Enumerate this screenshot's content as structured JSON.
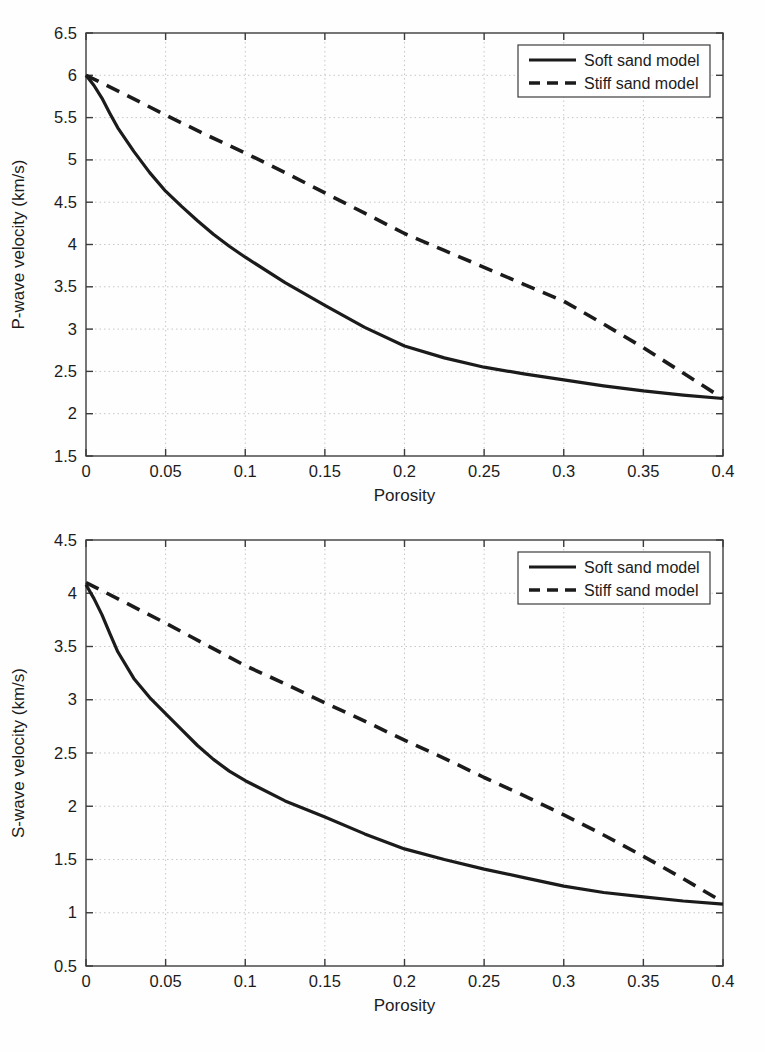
{
  "figure": {
    "background": "#fefefe"
  },
  "colors": {
    "line": "#1b1b1b",
    "axis_box": "#3c3c3c",
    "grid": "#c7c7c7",
    "text": "#1c1c1c",
    "legend_background": "#ffffff"
  },
  "chart_data": [
    {
      "id": "p-wave",
      "type": "line",
      "title": "",
      "xlabel": "Porosity",
      "ylabel": "P-wave velocity (km/s)",
      "xlim": [
        0,
        0.4
      ],
      "ylim": [
        1.5,
        6.5
      ],
      "grid": true,
      "legend_position": "top-right",
      "xticks": [
        0,
        0.05,
        0.1,
        0.15,
        0.2,
        0.25,
        0.3,
        0.35,
        0.4
      ],
      "xtick_labels": [
        "0",
        "0.05",
        "0.1",
        "0.15",
        "0.2",
        "0.25",
        "0.3",
        "0.35",
        "0.4"
      ],
      "yticks": [
        1.5,
        2,
        2.5,
        3,
        3.5,
        4,
        4.5,
        5,
        5.5,
        6,
        6.5
      ],
      "ytick_labels": [
        "1.5",
        "2",
        "2.5",
        "3",
        "3.5",
        "4",
        "4.5",
        "5",
        "5.5",
        "6",
        "6.5"
      ],
      "series": [
        {
          "name": "Soft sand model",
          "style": "solid",
          "x": [
            0,
            0.005,
            0.01,
            0.015,
            0.02,
            0.03,
            0.04,
            0.05,
            0.06,
            0.07,
            0.08,
            0.09,
            0.1,
            0.125,
            0.15,
            0.175,
            0.2,
            0.225,
            0.25,
            0.275,
            0.3,
            0.325,
            0.35,
            0.375,
            0.4
          ],
          "y": [
            6.0,
            5.88,
            5.73,
            5.55,
            5.38,
            5.1,
            4.85,
            4.63,
            4.45,
            4.28,
            4.12,
            3.98,
            3.85,
            3.55,
            3.28,
            3.02,
            2.8,
            2.66,
            2.55,
            2.47,
            2.4,
            2.33,
            2.27,
            2.22,
            2.18
          ]
        },
        {
          "name": "Stiff sand model",
          "style": "dashed",
          "x": [
            0,
            0.025,
            0.05,
            0.075,
            0.1,
            0.125,
            0.15,
            0.175,
            0.2,
            0.225,
            0.25,
            0.275,
            0.3,
            0.325,
            0.35,
            0.375,
            0.4
          ],
          "y": [
            6.0,
            5.77,
            5.53,
            5.3,
            5.08,
            4.85,
            4.61,
            4.37,
            4.13,
            3.93,
            3.73,
            3.53,
            3.33,
            3.06,
            2.78,
            2.48,
            2.18
          ]
        }
      ]
    },
    {
      "id": "s-wave",
      "type": "line",
      "title": "",
      "xlabel": "Porosity",
      "ylabel": "S-wave velocity (km/s)",
      "xlim": [
        0,
        0.4
      ],
      "ylim": [
        0.5,
        4.5
      ],
      "grid": true,
      "legend_position": "top-right",
      "xticks": [
        0,
        0.05,
        0.1,
        0.15,
        0.2,
        0.25,
        0.3,
        0.35,
        0.4
      ],
      "xtick_labels": [
        "0",
        "0.05",
        "0.1",
        "0.15",
        "0.2",
        "0.25",
        "0.3",
        "0.35",
        "0.4"
      ],
      "yticks": [
        0.5,
        1,
        1.5,
        2,
        2.5,
        3,
        3.5,
        4,
        4.5
      ],
      "ytick_labels": [
        "0.5",
        "1",
        "1.5",
        "2",
        "2.5",
        "3",
        "3.5",
        "4",
        "4.5"
      ],
      "series": [
        {
          "name": "Soft sand model",
          "style": "solid",
          "x": [
            0,
            0.005,
            0.01,
            0.015,
            0.02,
            0.03,
            0.04,
            0.05,
            0.06,
            0.07,
            0.08,
            0.09,
            0.1,
            0.125,
            0.15,
            0.175,
            0.2,
            0.225,
            0.25,
            0.275,
            0.3,
            0.325,
            0.35,
            0.375,
            0.4
          ],
          "y": [
            4.08,
            3.95,
            3.8,
            3.62,
            3.45,
            3.2,
            3.02,
            2.87,
            2.72,
            2.57,
            2.44,
            2.33,
            2.24,
            2.05,
            1.9,
            1.74,
            1.6,
            1.5,
            1.41,
            1.33,
            1.25,
            1.19,
            1.15,
            1.11,
            1.08
          ]
        },
        {
          "name": "Stiff sand model",
          "style": "dashed",
          "x": [
            0,
            0.025,
            0.05,
            0.075,
            0.1,
            0.125,
            0.15,
            0.175,
            0.2,
            0.225,
            0.25,
            0.275,
            0.3,
            0.325,
            0.35,
            0.375,
            0.4
          ],
          "y": [
            4.1,
            3.91,
            3.72,
            3.52,
            3.32,
            3.15,
            2.97,
            2.8,
            2.62,
            2.45,
            2.27,
            2.1,
            1.92,
            1.73,
            1.53,
            1.32,
            1.1
          ]
        }
      ]
    }
  ]
}
